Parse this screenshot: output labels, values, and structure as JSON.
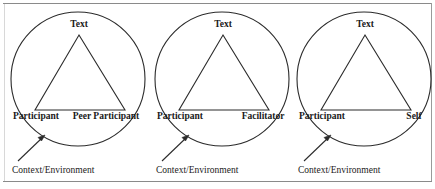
{
  "figure": {
    "type": "diagram",
    "frame": {
      "top_rule": true,
      "bottom_rule": true,
      "right_rule": true,
      "rule_color": "#8a8a8a"
    },
    "stroke_color": "#2b2b2b",
    "text_color": "#1a1a1a",
    "background": "#ffffff",
    "units": [
      {
        "id": "unit-1",
        "apex_label": "Text",
        "base_left_label": "Participant",
        "base_right_label": "Peer Participant",
        "context_label": "Context/Environment",
        "circle": {
          "cx": 76,
          "cy": 79,
          "r": 67
        },
        "triangle": {
          "apex_x": 77,
          "apex_y": 35,
          "base_y": 110,
          "base_left_x": 33,
          "base_right_x": 123
        },
        "arrow": {
          "from_x": 16,
          "from_y": 161,
          "to_x": 42,
          "to_y": 136
        }
      },
      {
        "id": "unit-2",
        "apex_label": "Text",
        "base_left_label": "Participant",
        "base_right_label": "Facilitator",
        "context_label": "Context/Environment",
        "circle": {
          "cx": 76,
          "cy": 79,
          "r": 67
        },
        "triangle": {
          "apex_x": 77,
          "apex_y": 35,
          "base_y": 110,
          "base_left_x": 33,
          "base_right_x": 123
        },
        "arrow": {
          "from_x": 16,
          "from_y": 161,
          "to_x": 42,
          "to_y": 136
        }
      },
      {
        "id": "unit-3",
        "apex_label": "Text",
        "base_left_label": "Participant",
        "base_right_label": "Self",
        "context_label": "Context/Environment",
        "circle": {
          "cx": 76,
          "cy": 79,
          "r": 67
        },
        "triangle": {
          "apex_x": 77,
          "apex_y": 35,
          "base_y": 110,
          "base_left_x": 33,
          "base_right_x": 123
        },
        "arrow": {
          "from_x": 16,
          "from_y": 161,
          "to_x": 42,
          "to_y": 136
        }
      }
    ]
  }
}
